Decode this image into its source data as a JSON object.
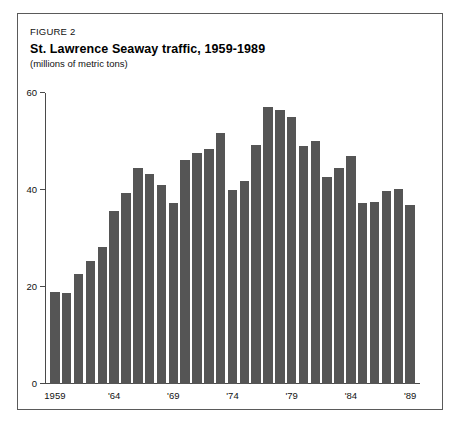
{
  "figure": {
    "label": "FIGURE 2",
    "title": "St. Lawrence Seaway traffic, 1959-1989",
    "subtitle": "(millions of metric tons)"
  },
  "colors": {
    "bar": "#555555",
    "axis": "#4a4a4a",
    "frame": "#5a5a5a",
    "tab": "#000000"
  },
  "chart_data": {
    "type": "bar",
    "title": "St. Lawrence Seaway traffic, 1959-1989",
    "subtitle": "(millions of metric tons)",
    "xlabel": "",
    "ylabel": "millions of metric tons",
    "ylim": [
      0,
      60
    ],
    "yticks": [
      0,
      20,
      40,
      60
    ],
    "ytick_labels": [
      "0",
      "20",
      "40",
      "60"
    ],
    "grid": false,
    "legend": null,
    "categories": [
      "1959",
      "1960",
      "1961",
      "1962",
      "1963",
      "1964",
      "1965",
      "1966",
      "1967",
      "1968",
      "1969",
      "1970",
      "1971",
      "1972",
      "1973",
      "1974",
      "1975",
      "1976",
      "1977",
      "1978",
      "1979",
      "1980",
      "1981",
      "1982",
      "1983",
      "1984",
      "1985",
      "1986",
      "1987",
      "1988",
      "1989"
    ],
    "xtick_labels": [
      {
        "category": "1959",
        "text": "1959"
      },
      {
        "category": "1964",
        "text": "'64"
      },
      {
        "category": "1969",
        "text": "'69"
      },
      {
        "category": "1974",
        "text": "'74"
      },
      {
        "category": "1979",
        "text": "'79"
      },
      {
        "category": "1984",
        "text": "'84"
      },
      {
        "category": "1989",
        "text": "'89"
      }
    ],
    "values": [
      19.0,
      18.8,
      22.7,
      25.3,
      28.2,
      35.6,
      39.3,
      44.5,
      43.2,
      41.0,
      37.3,
      46.2,
      47.7,
      48.5,
      51.8,
      40.0,
      41.8,
      49.2,
      57.2,
      56.4,
      55.0,
      49.0,
      50.2,
      42.6,
      44.5,
      47.0,
      37.4,
      37.5,
      39.7,
      40.2,
      36.9
    ]
  }
}
